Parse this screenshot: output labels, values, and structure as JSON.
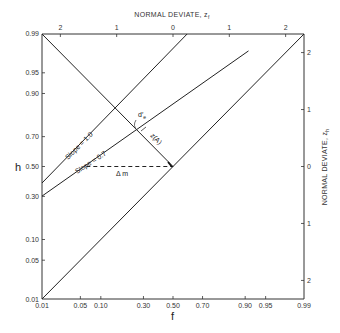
{
  "chart_data": {
    "type": "line",
    "title": "",
    "xlabel": "f",
    "ylabel": "h",
    "top_axis_label": "NORMAL DEVIATE, z_f",
    "right_axis_label": "NORMAL DEVIATE, z_h",
    "x_scale": "normal-probability",
    "y_scale": "normal-probability",
    "xlim": [
      0.01,
      0.99
    ],
    "ylim": [
      0.01,
      0.99
    ],
    "x_ticks": [
      "0.01",
      "0.05",
      "0.10",
      "0.30",
      "0.50",
      "0.70",
      "0.90",
      "0.95",
      "0.99"
    ],
    "x_tick_values": [
      0.01,
      0.05,
      0.1,
      0.3,
      0.5,
      0.7,
      0.9,
      0.95,
      0.99
    ],
    "y_ticks": [
      "0.01",
      "0.05",
      "0.10",
      "0.30",
      "0.50",
      "0.70",
      "0.90",
      "0.95",
      "0.99"
    ],
    "y_tick_values": [
      0.01,
      0.05,
      0.1,
      0.3,
      0.5,
      0.7,
      0.9,
      0.95,
      0.99
    ],
    "top_ticks": [
      "2",
      "1",
      "0",
      "1",
      "2"
    ],
    "top_tick_z": [
      -2,
      -1,
      0,
      1,
      2
    ],
    "right_ticks": [
      "2",
      "1",
      "0",
      "1",
      "2"
    ],
    "right_tick_z": [
      2,
      1,
      0,
      -1,
      -2
    ],
    "grid": false,
    "series": [
      {
        "name": "Chance diagonal (slope 1, d'=0)",
        "z_f": [
          -2.326,
          2.326
        ],
        "z_h": [
          -2.326,
          2.326
        ]
      },
      {
        "name": "Slope = 1.0",
        "z_f": [
          -2.326,
          0.25
        ],
        "z_h": [
          -0.29,
          2.326
        ]
      },
      {
        "name": "Slope = 0.7",
        "z_f": [
          -2.326,
          1.34
        ],
        "z_h": [
          -0.52,
          2.03
        ]
      },
      {
        "name": "Negative diagonal",
        "z_f": [
          -2.326,
          0
        ],
        "z_h": [
          2.326,
          0
        ]
      },
      {
        "name": "Δm (dashed)",
        "z_f": [
          -1.54,
          0
        ],
        "z_h": [
          0,
          0
        ],
        "style": "dashed"
      }
    ],
    "annotations": [
      {
        "text": "Slope = 1.0",
        "rotated": true
      },
      {
        "text": "Slope = 0.7",
        "rotated": true
      },
      {
        "text": "Δ m",
        "position": "below dashed line"
      },
      {
        "text": "d′e",
        "position": "near intersection of slope-0.7 line with negative diagonal"
      },
      {
        "text": "z(A)",
        "position": "along negative diagonal"
      }
    ]
  },
  "labels": {
    "top_title": "NORMAL DEVIATE, z",
    "top_title_sub": "f",
    "right_title": "NORMAL DEVIATE, z",
    "right_title_sub": "h",
    "x_name": "f",
    "y_name": "h",
    "slope1": "Slope = 1.0",
    "slope07": "Slope = 0.7",
    "delta_m": "Δ m",
    "de": "d′",
    "de_sub": "e",
    "za": "z(A)"
  }
}
